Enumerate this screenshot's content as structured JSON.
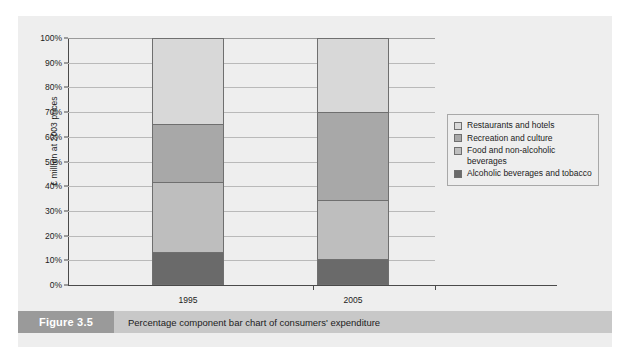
{
  "figure": {
    "tag": "Figure 3.5",
    "caption": "Percentage component bar chart of consumers' expenditure"
  },
  "legend": {
    "items": [
      {
        "label": "Restaurants and hotels",
        "color": "#d8d8d8",
        "swatch_name": "legend-swatch-restaurants-and-hotels"
      },
      {
        "label": "Recreation and culture",
        "color": "#a8a8a8",
        "swatch_name": "legend-swatch-recreation-and-culture"
      },
      {
        "label": "Food and non-alcoholic beverages",
        "color": "#bebebe",
        "swatch_name": "legend-swatch-food-and-non-alcoholic-beverages"
      },
      {
        "label": "Alcoholic beverages and tobacco",
        "color": "#6a6a6a",
        "swatch_name": "legend-swatch-alcoholic-beverages-and-tobacco"
      }
    ]
  },
  "chart_data": {
    "type": "bar",
    "subtype": "100% stacked bar (percentage component bar chart)",
    "title": "Percentage component bar chart of consumers' expenditure",
    "xlabel": "",
    "ylabel": "£ million at 2003 prices",
    "categories": [
      "1995",
      "2005"
    ],
    "ylim": [
      0,
      100
    ],
    "yticks": [
      0,
      10,
      20,
      30,
      40,
      50,
      60,
      70,
      80,
      90,
      100
    ],
    "ytick_labels": [
      "0%",
      "10%",
      "20%",
      "30%",
      "40%",
      "50%",
      "60%",
      "70%",
      "80%",
      "90%",
      "100%"
    ],
    "grid": true,
    "legend_position": "right",
    "stack_order_bottom_to_top": [
      "Alcoholic beverages and tobacco",
      "Food and non-alcoholic beverages",
      "Recreation and culture",
      "Restaurants and hotels"
    ],
    "series": [
      {
        "name": "Alcoholic beverages and tobacco",
        "color": "#6a6a6a",
        "values": [
          13.5,
          10.7
        ],
        "cumulative_top": [
          13.5,
          10.7
        ]
      },
      {
        "name": "Food and non-alcoholic beverages",
        "color": "#bebebe",
        "values": [
          28.0,
          23.8
        ],
        "cumulative_top": [
          41.5,
          34.5
        ]
      },
      {
        "name": "Recreation and culture",
        "color": "#a8a8a8",
        "values": [
          23.5,
          35.5
        ],
        "cumulative_top": [
          65.0,
          70.0
        ]
      },
      {
        "name": "Restaurants and hotels",
        "color": "#d8d8d8",
        "values": [
          35.0,
          30.0
        ],
        "cumulative_top": [
          100.0,
          100.0
        ]
      }
    ]
  }
}
